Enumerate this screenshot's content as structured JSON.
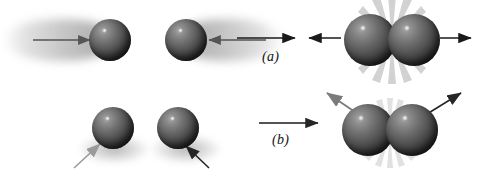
{
  "figure": {
    "background_color": "#ffffff",
    "width": 477,
    "height": 177,
    "sphere_color_light": "#a9a9a9",
    "sphere_color_dark": "#121212",
    "arrow_color_dark": "#1a1a1a",
    "arrow_color_gray": "#8a8a8a",
    "burst_color": "#b8b8b8"
  },
  "rows": [
    {
      "id": "a",
      "label": "(a)",
      "description": "Head-on collision: two spheres approach each other with motion blur, collide, and rebound in opposite directions",
      "before": {
        "spheres": [
          {
            "name": "sphere-a-left",
            "cx": 110,
            "cy": 40,
            "r": 21
          },
          {
            "name": "sphere-a-right",
            "cx": 186,
            "cy": 40,
            "r": 21
          }
        ],
        "arrows": [
          {
            "name": "arrow-a-in-left",
            "direction": "right",
            "x1": 33,
            "y1": 40,
            "x2": 92,
            "y2": 40,
            "color": "#555555"
          },
          {
            "name": "arrow-a-in-right",
            "direction": "left",
            "x1": 265,
            "y1": 40,
            "x2": 205,
            "y2": 40,
            "color": "#555555"
          }
        ],
        "motion_blur": true
      },
      "transition": {
        "name": "transition-arrow-a",
        "direction": "right",
        "x1": 237,
        "y1": 38,
        "x2": 298,
        "y2": 38,
        "color": "#1a1a1a"
      },
      "after": {
        "spheres": [
          {
            "name": "sphere-a-out-left",
            "cx": 370,
            "cy": 40,
            "r": 26
          },
          {
            "name": "sphere-a-out-right",
            "cx": 414,
            "cy": 40,
            "r": 26
          }
        ],
        "arrows": [
          {
            "name": "arrow-a-out-left",
            "direction": "left",
            "x1": 340,
            "y1": 38,
            "x2": 306,
            "y2": 38,
            "color": "#1a1a1a"
          },
          {
            "name": "arrow-a-out-right",
            "direction": "right",
            "x1": 438,
            "y1": 38,
            "x2": 474,
            "y2": 38,
            "color": "#1a1a1a"
          }
        ],
        "impact_burst": true
      }
    },
    {
      "id": "b",
      "label": "(b)",
      "description": "Glancing collision: two spheres struck from below-left deflect upward and outward after contact",
      "before": {
        "spheres": [
          {
            "name": "sphere-b-left",
            "cx": 113,
            "cy": 128,
            "r": 21
          },
          {
            "name": "sphere-b-right",
            "cx": 178,
            "cy": 128,
            "r": 21
          }
        ],
        "arrows": [
          {
            "name": "arrow-b-in-left",
            "direction": "up-right",
            "x1": 76,
            "y1": 168,
            "x2": 101,
            "y2": 144,
            "color": "#9a9a9a"
          },
          {
            "name": "arrow-b-in-right",
            "direction": "up-right",
            "x1": 208,
            "y1": 168,
            "x2": 186,
            "y2": 145,
            "color": "#333333"
          }
        ],
        "motion_blur": false
      },
      "transition": {
        "name": "transition-arrow-b",
        "direction": "right",
        "x1": 260,
        "y1": 123,
        "x2": 320,
        "y2": 123,
        "color": "#1a1a1a"
      },
      "after": {
        "spheres": [
          {
            "name": "sphere-b-out-left",
            "cx": 368,
            "cy": 130,
            "r": 26
          },
          {
            "name": "sphere-b-out-right",
            "cx": 412,
            "cy": 130,
            "r": 26
          }
        ],
        "arrows": [
          {
            "name": "arrow-b-out-left",
            "direction": "up-left",
            "x1": 358,
            "y1": 112,
            "x2": 325,
            "y2": 92,
            "color": "#7b7b7b"
          },
          {
            "name": "arrow-b-out-right",
            "direction": "up-right",
            "x1": 428,
            "y1": 112,
            "x2": 463,
            "y2": 92,
            "color": "#1a1a1a"
          }
        ],
        "impact_burst": true
      }
    }
  ]
}
